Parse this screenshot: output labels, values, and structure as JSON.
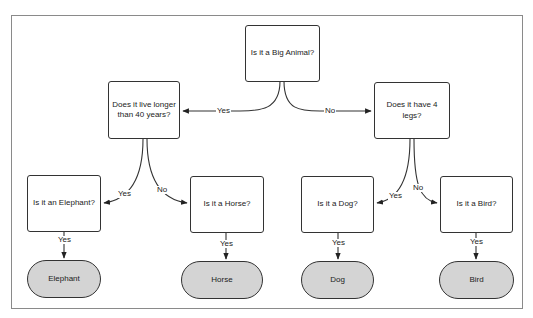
{
  "diagram": {
    "type": "decision-tree",
    "nodes": {
      "root": {
        "label": "Is it a Big Animal?",
        "kind": "decision"
      },
      "lifespan": {
        "label": "Does it live longer than 40 years?",
        "kind": "decision"
      },
      "legs": {
        "label": "Does it have 4 legs?",
        "kind": "decision"
      },
      "q_elephant": {
        "label": "Is it an Elephant?",
        "kind": "decision"
      },
      "q_horse": {
        "label": "Is it a Horse?",
        "kind": "decision"
      },
      "q_dog": {
        "label": "Is it a Dog?",
        "kind": "decision"
      },
      "q_bird": {
        "label": "Is it a Bird?",
        "kind": "decision"
      },
      "t_elephant": {
        "label": "Elephant",
        "kind": "terminal"
      },
      "t_horse": {
        "label": "Horse",
        "kind": "terminal"
      },
      "t_dog": {
        "label": "Dog",
        "kind": "terminal"
      },
      "t_bird": {
        "label": "Bird",
        "kind": "terminal"
      }
    },
    "edges": [
      {
        "from": "root",
        "to": "lifespan",
        "label": "Yes"
      },
      {
        "from": "root",
        "to": "legs",
        "label": "No"
      },
      {
        "from": "lifespan",
        "to": "q_elephant",
        "label": "Yes"
      },
      {
        "from": "lifespan",
        "to": "q_horse",
        "label": "No"
      },
      {
        "from": "legs",
        "to": "q_dog",
        "label": "Yes"
      },
      {
        "from": "legs",
        "to": "q_bird",
        "label": "No"
      },
      {
        "from": "q_elephant",
        "to": "t_elephant",
        "label": "Yes"
      },
      {
        "from": "q_horse",
        "to": "t_horse",
        "label": "Yes"
      },
      {
        "from": "q_dog",
        "to": "t_dog",
        "label": "Yes"
      },
      {
        "from": "q_bird",
        "to": "t_bird",
        "label": "Yes"
      }
    ],
    "colors": {
      "terminal_fill": "#d4d4d4",
      "stroke": "#333333"
    }
  }
}
